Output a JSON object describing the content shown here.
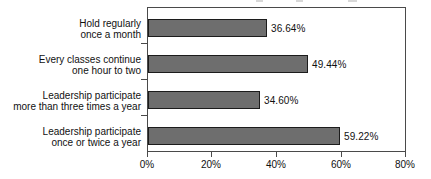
{
  "chart_data": {
    "type": "bar",
    "orientation": "horizontal",
    "title": "",
    "xlabel": "",
    "ylabel": "",
    "xlim": [
      0,
      80
    ],
    "grid": false,
    "legend": false,
    "categories": [
      "Hold regularly once a month",
      "Every classes continue one hour to two",
      "Leadership participate more than three times a year",
      "Leadership participate once or twice a year"
    ],
    "category_lines": [
      [
        "Hold regularly",
        "once a month"
      ],
      [
        "Every classes continue",
        "one hour to two"
      ],
      [
        "Leadership participate",
        "more than three times a year"
      ],
      [
        "Leadership participate",
        "once or twice a year"
      ]
    ],
    "values": [
      36.64,
      49.44,
      34.6,
      59.22
    ],
    "value_labels": [
      "36.64%",
      "49.44%",
      "34.60%",
      "59.22%"
    ],
    "xticks": [
      0,
      20,
      40,
      60,
      80
    ],
    "xtick_labels": [
      "0%",
      "20%",
      "40%",
      "60%",
      "80%"
    ],
    "bar_color": "#6e6e6e",
    "bar_border_color": "#1c1c1c",
    "axis_color": "#4a4a4a",
    "text_color": "#111111",
    "background_color": "#ffffff"
  }
}
